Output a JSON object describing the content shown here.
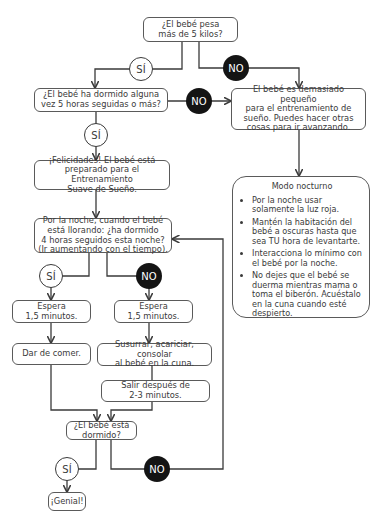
{
  "flowchart": {
    "nodes": {
      "weight_question": "¿El bebé pesa\nmás de 5 kilos?",
      "slept_5h_question": "¿El bebé ha dormido alguna\nvez 5 horas seguidas o más?",
      "too_small": "El bebé es demasiado pequeño\npara el entrenamiento de\nsueño. Puedes hacer otras\ncosas para ir avanzando.",
      "congrats": "¡Felicidades! El bebé está\npreparado para el Entrenamiento\nSuave de Sueño.",
      "night_question": "Por la noche, cuando el bebé\nestá llorando: ¿ha dormido\n4 horas seguidos esta noche?\n(Ir aumentando con el tiempo).",
      "wait_yes": "Espera\n1,5 minutos.",
      "wait_no": "Espera\n1,5 minutos.",
      "feed": "Dar de comer.",
      "soothe": "Susurrar, acariciar, consolar\nal bebé en la cuna.",
      "leave": "Salir después de\n2-3 minutos.",
      "asleep_question": "¿El bebé está\ndormido?",
      "great": "¡Genial!"
    },
    "decisions": {
      "yes_label": "SÍ",
      "no_label": "NO"
    },
    "night_mode": {
      "title": "Modo nocturno",
      "items": [
        "Por la noche usar solamente la luz roja.",
        "Mantén la habitación del bebé a oscuras hasta que sea TU hora de levantarte.",
        "Interacciona lo mínimo con el bebé por la noche.",
        "No dejes que el bebé se duerma mientras mama o toma el biberón. Acuéstalo en la cuna cuando esté despierto."
      ]
    },
    "colors": {
      "line": "#3a3a3a",
      "no_fill": "#141414",
      "yes_fill": "#ffffff"
    }
  }
}
